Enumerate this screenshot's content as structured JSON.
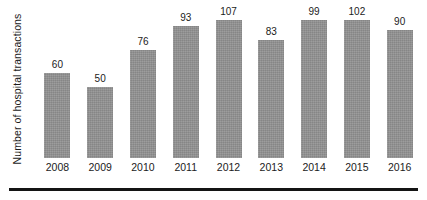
{
  "chart_data": {
    "type": "bar",
    "title": "",
    "subtitle": "",
    "xlabel": "",
    "ylabel": "Number of hospital transactions",
    "categories": [
      "2008",
      "2009",
      "2010",
      "2011",
      "2012",
      "2013",
      "2014",
      "2015",
      "2016"
    ],
    "values": [
      60,
      50,
      76,
      93,
      107,
      83,
      99,
      102,
      90
    ],
    "data_labels": [
      "60",
      "50",
      "76",
      "93",
      "107",
      "83",
      "99",
      "102",
      "90"
    ],
    "ylim": [
      0,
      107
    ],
    "grid": false,
    "legend": false,
    "legend_position": "none",
    "series": [
      {
        "name": "Number of hospital transactions",
        "values": [
          60,
          50,
          76,
          93,
          107,
          83,
          99,
          102,
          90
        ]
      }
    ]
  },
  "style": {
    "bar_color": "#919191",
    "label_color": "#1b1b1b",
    "axis_rule_color": "#141414",
    "background_color": "#ffffff"
  },
  "axes": {
    "y_title": "Number of hospital transactions",
    "x_ticks": [
      "2008",
      "2009",
      "2010",
      "2011",
      "2012",
      "2013",
      "2014",
      "2015",
      "2016"
    ]
  }
}
